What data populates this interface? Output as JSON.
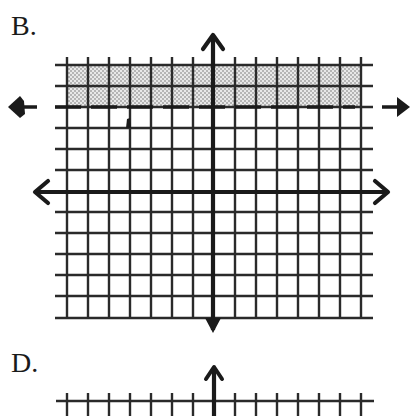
{
  "problems": [
    {
      "label": "B.",
      "graph": {
        "x_range": [
          -7,
          7
        ],
        "y_range": [
          -6,
          6
        ],
        "grid_step": 1,
        "boundary": {
          "type": "horizontal-line",
          "equation": "y = 4",
          "style": "dashed"
        },
        "shaded_region": "y > 4",
        "inequality": "y > 4",
        "colors": {
          "grid": "#2a2a2a",
          "axes": "#1a1a1a",
          "shading_dot": "#7a7a7a",
          "shading_bg": "#e6e6e6"
        }
      }
    },
    {
      "label": "D.",
      "graph": {
        "partially_visible": true
      }
    }
  ]
}
